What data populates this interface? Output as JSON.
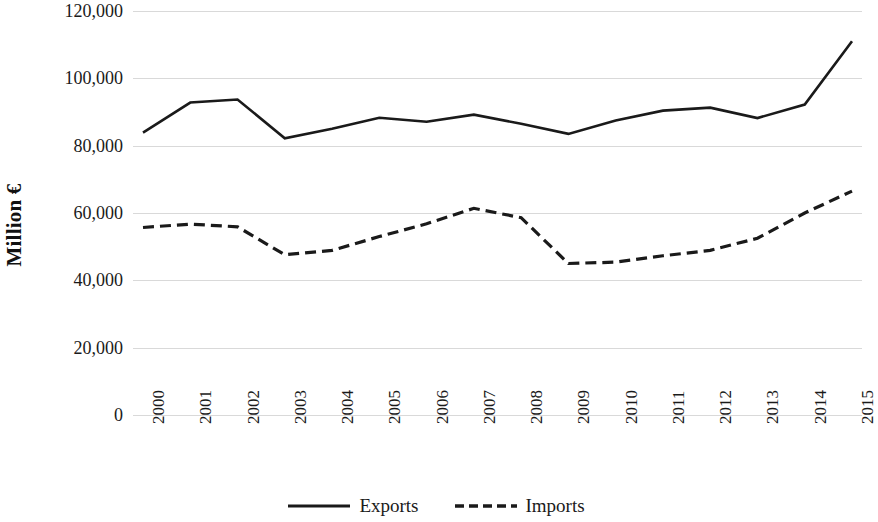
{
  "chart_data": {
    "type": "line",
    "title": "",
    "xlabel": "",
    "ylabel": "Million €",
    "categories": [
      "2000",
      "2001",
      "2002",
      "2003",
      "2004",
      "2005",
      "2006",
      "2007",
      "2008",
      "2009",
      "2010",
      "2011",
      "2012",
      "2013",
      "2014",
      "2015"
    ],
    "x": [
      2000,
      2001,
      2002,
      2003,
      2004,
      2005,
      2006,
      2007,
      2008,
      2009,
      2010,
      2011,
      2012,
      2013,
      2014,
      2015
    ],
    "series": [
      {
        "name": "Exports",
        "style": "solid",
        "color": "#1a1a1a",
        "values": [
          83900,
          92800,
          93700,
          82200,
          85000,
          88300,
          87100,
          89200,
          86500,
          83500,
          87500,
          90400,
          91300,
          88200,
          92200,
          111000
        ]
      },
      {
        "name": "Imports",
        "style": "dashed",
        "color": "#1a1a1a",
        "values": [
          55700,
          56700,
          55900,
          47600,
          48900,
          53000,
          56800,
          61400,
          58600,
          45000,
          45400,
          47300,
          48900,
          52500,
          60000,
          66500
        ]
      }
    ],
    "ylim": [
      0,
      120000
    ],
    "yticks": [
      0,
      20000,
      40000,
      60000,
      80000,
      100000,
      120000
    ],
    "ytick_labels": [
      "0",
      "20,000",
      "40,000",
      "60,000",
      "80,000",
      "100,000",
      "120,000"
    ],
    "grid": true,
    "grid_color": "#d9d9d9",
    "legend_position": "bottom-center",
    "legend_entries": [
      "Exports",
      "Imports"
    ]
  }
}
